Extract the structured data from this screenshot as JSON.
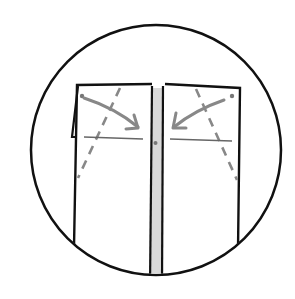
{
  "diagram": {
    "type": "sewing-instruction-illustration",
    "colors": {
      "outline": "#111111",
      "guide": "#888888",
      "strip_fill": "#d9d9d9",
      "background": "#ffffff"
    },
    "elements": {
      "circle_frame": {
        "cx": 156,
        "cy": 150,
        "r": 125
      },
      "left_panel": {
        "label": ""
      },
      "right_panel": {
        "label": ""
      },
      "center_strip": {
        "label": ""
      },
      "left_arrow": {
        "direction": "down-right"
      },
      "right_arrow": {
        "direction": "down-left"
      }
    }
  }
}
